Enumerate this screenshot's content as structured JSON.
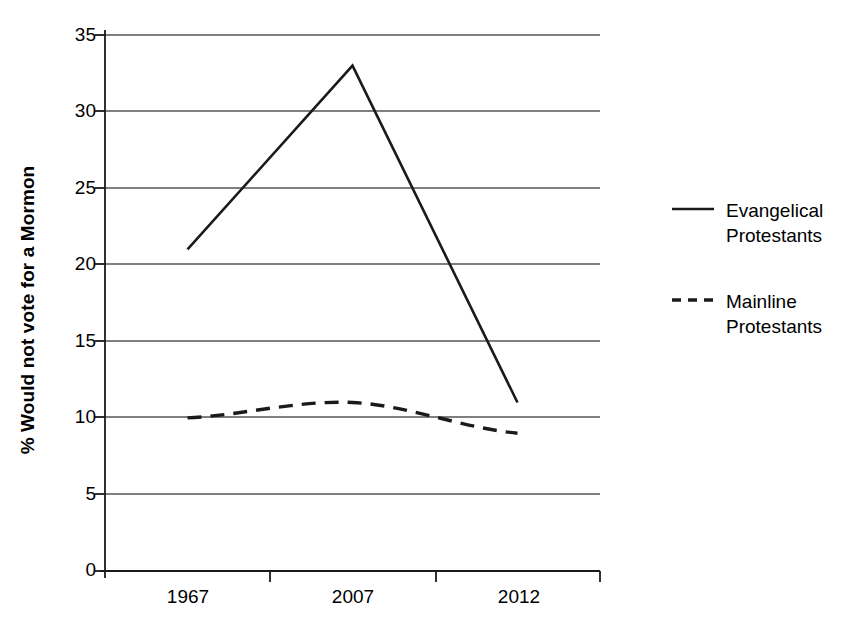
{
  "chart_data": {
    "type": "line",
    "title": "",
    "subtitle": "",
    "xlabel": "",
    "ylabel": "% Would not vote for a Mormon",
    "categories": [
      "1967",
      "2007",
      "2012"
    ],
    "xtick_labels": [
      "1967",
      "2007",
      "2012"
    ],
    "ytick_labels": [
      "0",
      "5",
      "10",
      "15",
      "20",
      "25",
      "30",
      "35"
    ],
    "yticks": [
      0,
      5,
      10,
      15,
      20,
      25,
      30,
      35
    ],
    "ylim": [
      0,
      35
    ],
    "grid": "horizontal",
    "legend_position": "right",
    "series": [
      {
        "name": "Evangelical Protestants",
        "legend_label": "Evangelical\nProtestants",
        "style": "solid",
        "color": "#1a1a1a",
        "values": [
          21,
          33,
          11
        ]
      },
      {
        "name": "Mainline Protestants",
        "legend_label": "Mainline\nProtestants",
        "style": "dashed",
        "color": "#1a1a1a",
        "values": [
          10,
          11,
          9
        ]
      }
    ],
    "annotations": []
  },
  "axes": {
    "y_axis_label": "% Would not vote for a Mormon",
    "y_tick_0": "0",
    "y_tick_5": "5",
    "y_tick_10": "10",
    "y_tick_15": "15",
    "y_tick_20": "20",
    "y_tick_25": "25",
    "y_tick_30": "30",
    "y_tick_35": "35",
    "x_tick_1": "1967",
    "x_tick_2": "2007",
    "x_tick_3": "2012"
  },
  "legend": {
    "entries": [
      {
        "label": "Evangelical\nProtestants",
        "style": "solid"
      },
      {
        "label": "Mainline\nProtestants",
        "style": "dashed"
      }
    ],
    "entry_1_label": "Evangelical\nProtestants",
    "entry_2_label": "Mainline\nProtestants"
  },
  "colors": {
    "line": "#1a1a1a",
    "grid": "#555555",
    "axis": "#1a1a1a",
    "background": "#ffffff"
  }
}
